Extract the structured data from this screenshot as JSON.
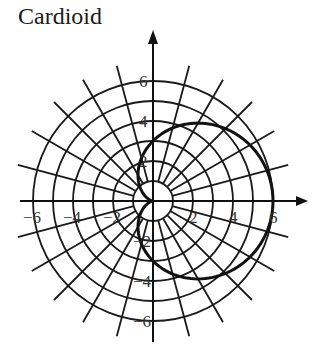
{
  "title": "Cardioid",
  "chart_data": {
    "type": "line",
    "subtype": "polar",
    "title": "Cardioid",
    "equation": "r = 3(1 + cos θ)",
    "series": [
      {
        "name": "cardioid",
        "points_polar": [
          {
            "theta_deg": 0,
            "r": 6
          },
          {
            "theta_deg": 30,
            "r": 5.6
          },
          {
            "theta_deg": 60,
            "r": 4.5
          },
          {
            "theta_deg": 90,
            "r": 3
          },
          {
            "theta_deg": 120,
            "r": 1.5
          },
          {
            "theta_deg": 150,
            "r": 0.4
          },
          {
            "theta_deg": 180,
            "r": 0
          },
          {
            "theta_deg": 210,
            "r": 0.4
          },
          {
            "theta_deg": 240,
            "r": 1.5
          },
          {
            "theta_deg": 270,
            "r": 3
          },
          {
            "theta_deg": 300,
            "r": 4.5
          },
          {
            "theta_deg": 330,
            "r": 5.6
          },
          {
            "theta_deg": 360,
            "r": 6
          }
        ]
      }
    ],
    "grid": {
      "circles_r": [
        1,
        2,
        3,
        4,
        5,
        6
      ],
      "radial_step_deg": 15,
      "radial_inner_r": 1,
      "radial_outer_r": 7
    },
    "x_ticks": [
      -6,
      -4,
      -2,
      2,
      4,
      6
    ],
    "y_ticks": [
      6,
      4,
      2,
      -2,
      -4,
      -6
    ],
    "x_tick_labels": [
      "−6",
      "−4",
      "−2",
      "2",
      "4",
      "6"
    ],
    "y_tick_labels": [
      "6",
      "4",
      "2",
      "−2",
      "−4",
      "−6"
    ],
    "xlim": [
      -7,
      7
    ],
    "ylim": [
      -7,
      7
    ],
    "xlabel": "",
    "ylabel": "",
    "legend": "none",
    "colors": {
      "grid": "#1a1a1a",
      "curve": "#111111",
      "axes": "#111111",
      "labels": "#333333"
    }
  }
}
